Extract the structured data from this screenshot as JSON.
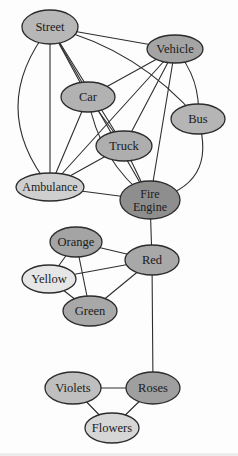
{
  "figure": {
    "type": "semantic-network-diagram",
    "background": "#fdfdfd",
    "edge_color": "#2e2e2e",
    "edge_width": 1.1,
    "node_stroke_color": "#2b2b2b",
    "node_stroke_width": 1.3,
    "label_color": "#1b1b1b",
    "canvas": {
      "width": 238,
      "height": 456
    },
    "nodes": [
      {
        "id": "street",
        "label": "Street",
        "lines": [
          "Street"
        ],
        "x": 50,
        "y": 27,
        "rx": 28,
        "ry": 17,
        "fill": "#b7b7b7",
        "font_size": 12.5
      },
      {
        "id": "vehicle",
        "label": "Vehicle",
        "lines": [
          "Vehicle"
        ],
        "x": 175,
        "y": 49,
        "rx": 28,
        "ry": 14,
        "fill": "#a4a4a4",
        "font_size": 12.5
      },
      {
        "id": "car",
        "label": "Car",
        "lines": [
          "Car"
        ],
        "x": 88,
        "y": 97,
        "rx": 27,
        "ry": 15,
        "fill": "#b2b2b2",
        "font_size": 12.5
      },
      {
        "id": "bus",
        "label": "Bus",
        "lines": [
          "Bus"
        ],
        "x": 198,
        "y": 119,
        "rx": 27,
        "ry": 15,
        "fill": "#b5b5b5",
        "font_size": 12.5
      },
      {
        "id": "truck",
        "label": "Truck",
        "lines": [
          "Truck"
        ],
        "x": 124,
        "y": 146,
        "rx": 28,
        "ry": 15,
        "fill": "#aeaeae",
        "font_size": 12.5
      },
      {
        "id": "ambulance",
        "label": "Ambulance",
        "lines": [
          "Ambulance"
        ],
        "x": 50,
        "y": 187,
        "rx": 34,
        "ry": 14,
        "fill": "#cfcfcf",
        "font_size": 12
      },
      {
        "id": "fire-engine",
        "label": "Fire Engine",
        "lines": [
          "Fire",
          "Engine"
        ],
        "x": 150,
        "y": 200,
        "rx": 30,
        "ry": 19,
        "fill": "#8e8e8e",
        "font_size": 12
      },
      {
        "id": "orange",
        "label": "Orange",
        "lines": [
          "Orange"
        ],
        "x": 76,
        "y": 242,
        "rx": 26,
        "ry": 15,
        "fill": "#a4a4a4",
        "font_size": 12.5
      },
      {
        "id": "red",
        "label": "Red",
        "lines": [
          "Red"
        ],
        "x": 152,
        "y": 260,
        "rx": 27,
        "ry": 15,
        "fill": "#a8a8a8",
        "font_size": 12.5
      },
      {
        "id": "yellow",
        "label": "Yellow",
        "lines": [
          "Yellow"
        ],
        "x": 49,
        "y": 279,
        "rx": 27,
        "ry": 14,
        "fill": "#e6e6e6",
        "font_size": 12.5
      },
      {
        "id": "green",
        "label": "Green",
        "lines": [
          "Green"
        ],
        "x": 90,
        "y": 311,
        "rx": 27,
        "ry": 15,
        "fill": "#a8a8a8",
        "font_size": 12.5
      },
      {
        "id": "violets",
        "label": "Violets",
        "lines": [
          "Violets"
        ],
        "x": 73,
        "y": 388,
        "rx": 28,
        "ry": 16,
        "fill": "#bfbfbf",
        "font_size": 12.5
      },
      {
        "id": "roses",
        "label": "Roses",
        "lines": [
          "Roses"
        ],
        "x": 153,
        "y": 388,
        "rx": 27,
        "ry": 16,
        "fill": "#9f9f9f",
        "font_size": 12.5
      },
      {
        "id": "flowers",
        "label": "Flowers",
        "lines": [
          "Flowers"
        ],
        "x": 112,
        "y": 428,
        "rx": 27,
        "ry": 15,
        "fill": "#d6d6d6",
        "font_size": 12.5
      }
    ],
    "edges": [
      {
        "from": "street",
        "to": "vehicle",
        "bow": 0
      },
      {
        "from": "street",
        "to": "bus",
        "bow": 14
      },
      {
        "from": "street",
        "to": "car",
        "bow": 0
      },
      {
        "from": "street",
        "to": "truck",
        "bow": 0
      },
      {
        "from": "street",
        "to": "ambulance",
        "bow": 0
      },
      {
        "from": "street",
        "to": "ambulance",
        "bow": -32
      },
      {
        "from": "street",
        "to": "fire-engine",
        "bow": 0
      },
      {
        "from": "vehicle",
        "to": "car",
        "bow": 0
      },
      {
        "from": "vehicle",
        "to": "bus",
        "bow": 8
      },
      {
        "from": "vehicle",
        "to": "truck",
        "bow": 0
      },
      {
        "from": "vehicle",
        "to": "ambulance",
        "bow": 0
      },
      {
        "from": "vehicle",
        "to": "fire-engine",
        "bow": 0
      },
      {
        "from": "car",
        "to": "truck",
        "bow": 0
      },
      {
        "from": "car",
        "to": "ambulance",
        "bow": 0
      },
      {
        "from": "car",
        "to": "fire-engine",
        "bow": -12
      },
      {
        "from": "truck",
        "to": "ambulance",
        "bow": 0
      },
      {
        "from": "truck",
        "to": "fire-engine",
        "bow": 0
      },
      {
        "from": "bus",
        "to": "fire-engine",
        "bow": 26
      },
      {
        "from": "ambulance",
        "to": "fire-engine",
        "bow": 0
      },
      {
        "from": "fire-engine",
        "to": "red",
        "bow": 0
      },
      {
        "from": "red",
        "to": "orange",
        "bow": 0
      },
      {
        "from": "red",
        "to": "yellow",
        "bow": 0
      },
      {
        "from": "red",
        "to": "green",
        "bow": 0
      },
      {
        "from": "red",
        "to": "roses",
        "bow": 0
      },
      {
        "from": "orange",
        "to": "yellow",
        "bow": 0
      },
      {
        "from": "orange",
        "to": "green",
        "bow": 0
      },
      {
        "from": "yellow",
        "to": "green",
        "bow": 0
      },
      {
        "from": "roses",
        "to": "violets",
        "bow": 0
      },
      {
        "from": "roses",
        "to": "flowers",
        "bow": 0
      },
      {
        "from": "violets",
        "to": "flowers",
        "bow": 0
      }
    ]
  }
}
